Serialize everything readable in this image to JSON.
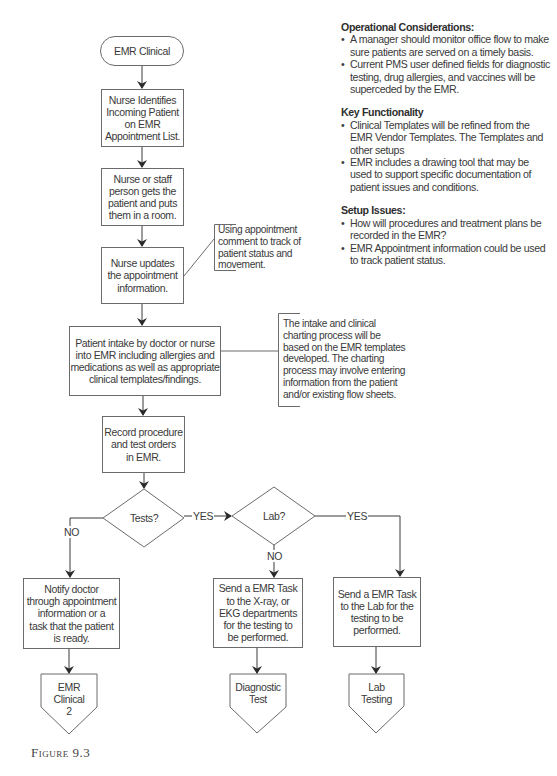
{
  "figure": {
    "caption": "Figure 9.3"
  },
  "colors": {
    "stroke": "#6b6b6b",
    "text": "#3a3a3a",
    "background": "#ffffff"
  },
  "flowchart": {
    "nodes": {
      "start": {
        "type": "terminator",
        "label": "EMR Clinical"
      },
      "identify": {
        "type": "process",
        "label": "Nurse Identifies\nIncoming Patient\non EMR\nAppointment List."
      },
      "room": {
        "type": "process",
        "label": "Nurse or staff\nperson gets the\npatient and puts\nthem in a room."
      },
      "update": {
        "type": "process",
        "label": "Nurse updates\nthe appointment\ninformation."
      },
      "intake": {
        "type": "process",
        "label": "Patient intake by doctor or nurse\ninto EMR including allergies and\nmedications as well as appropriate\nclinical templates/findings."
      },
      "record": {
        "type": "process",
        "label": "Record procedure\nand test orders\nin EMR."
      },
      "tests": {
        "type": "decision",
        "label": "Tests?"
      },
      "lab": {
        "type": "decision",
        "label": "Lab?"
      },
      "notify": {
        "type": "process",
        "label": "Notify doctor\nthrough appointment\ninformation or a\ntask that the patient\nis ready."
      },
      "xray": {
        "type": "process",
        "label": "Send a EMR Task\nto the X-ray, or\nEKG departments\nfor the testing to\nbe performed."
      },
      "labtask": {
        "type": "process",
        "label": "Send a EMR Task\nto the Lab for the\ntesting to be\nperformed."
      },
      "clinical2": {
        "type": "offpage",
        "label": "EMR\nClinical\n2"
      },
      "diagnostic": {
        "type": "offpage",
        "label": "Diagnostic\nTest"
      },
      "labtesting": {
        "type": "offpage",
        "label": "Lab\nTesting"
      }
    },
    "annotations": {
      "appointment_note": "Using appointment\ncomment to track of\npatient status and\nmovement.",
      "intake_note": "The intake and clinical\ncharting process will be\nbased on the EMR templates\ndeveloped. The charting\nprocess may involve entering\ninformation from the patient\nand/or existing flow sheets."
    },
    "edge_labels": {
      "tests_no": "NO",
      "tests_yes": "YES",
      "lab_no": "NO",
      "lab_yes": "YES"
    }
  },
  "notes": {
    "sections": [
      {
        "title": "Operational Considerations:",
        "items": [
          "A manager should monitor office flow to make sure patients are served on a timely basis.",
          "Current PMS user defined fields for diagnostic testing, drug allergies, and vaccines will be superceded by the EMR."
        ]
      },
      {
        "title": "Key Functionality",
        "items": [
          "Clinical Templates will be refined from the EMR Vendor Templates. The Templates and other setups",
          "EMR includes a drawing tool that may be used to support specific documentation of patient issues and conditions."
        ]
      },
      {
        "title": "Setup Issues:",
        "items": [
          "How will procedures and treatment plans be recorded in the EMR?",
          "EMR Appointment information could be used to track patient status."
        ]
      }
    ]
  }
}
